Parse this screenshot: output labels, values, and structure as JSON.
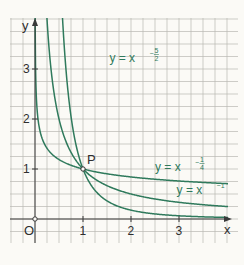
{
  "chart_data": {
    "type": "line",
    "title": "",
    "xlabel": "x",
    "ylabel": "y",
    "xlim": [
      -0.5,
      4.2
    ],
    "ylim": [
      -0.5,
      4.0
    ],
    "grid": true,
    "grid_step": 0.25,
    "x_ticks": [
      1,
      2,
      3
    ],
    "x_tick_labels": [
      "1",
      "2",
      "3"
    ],
    "y_ticks": [
      1,
      2,
      3
    ],
    "y_tick_labels": [
      "1",
      "2",
      "3"
    ],
    "origin_label": "O",
    "series": [
      {
        "name": "y = x^(-5/2)",
        "exponent": -2.5,
        "label_base": "y = x",
        "label_exp_num": "5",
        "label_exp_den": "2",
        "label_at": [
          1.55,
          3.15
        ]
      },
      {
        "name": "y = x^(-1)",
        "exponent": -1,
        "label_base": "y = x",
        "label_exp": "-1",
        "label_at": [
          2.95,
          0.5
        ]
      },
      {
        "name": "y = x^(-1/4)",
        "exponent": -0.25,
        "label_base": "y = x",
        "label_exp_num": "1",
        "label_exp_den": "4",
        "label_at": [
          2.5,
          0.97
        ]
      }
    ],
    "annotations": [
      {
        "label": "P",
        "x": 1,
        "y": 1
      }
    ],
    "colors": {
      "curve": "#2f7a5c",
      "axis": "#3a3a3a",
      "grid": "#b9b8b3",
      "background": "#fbfaf6"
    }
  }
}
